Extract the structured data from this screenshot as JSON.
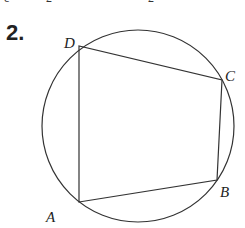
{
  "problem": {
    "number": "2.",
    "top_remnants": [
      "c",
      "2",
      "2"
    ]
  },
  "diagram": {
    "type": "cyclic-quadrilateral",
    "circle": {
      "cx": 138,
      "cy": 126,
      "r": 96
    },
    "vertices": [
      {
        "label": "A",
        "x": 79,
        "y": 202,
        "lx": 46,
        "ly": 222
      },
      {
        "label": "B",
        "x": 217,
        "y": 180,
        "lx": 220,
        "ly": 197
      },
      {
        "label": "C",
        "x": 222,
        "y": 80,
        "lx": 224,
        "ly": 80
      },
      {
        "label": "D",
        "x": 79,
        "y": 46,
        "lx": 64,
        "ly": 47
      }
    ],
    "stroke_color": "#333333"
  }
}
